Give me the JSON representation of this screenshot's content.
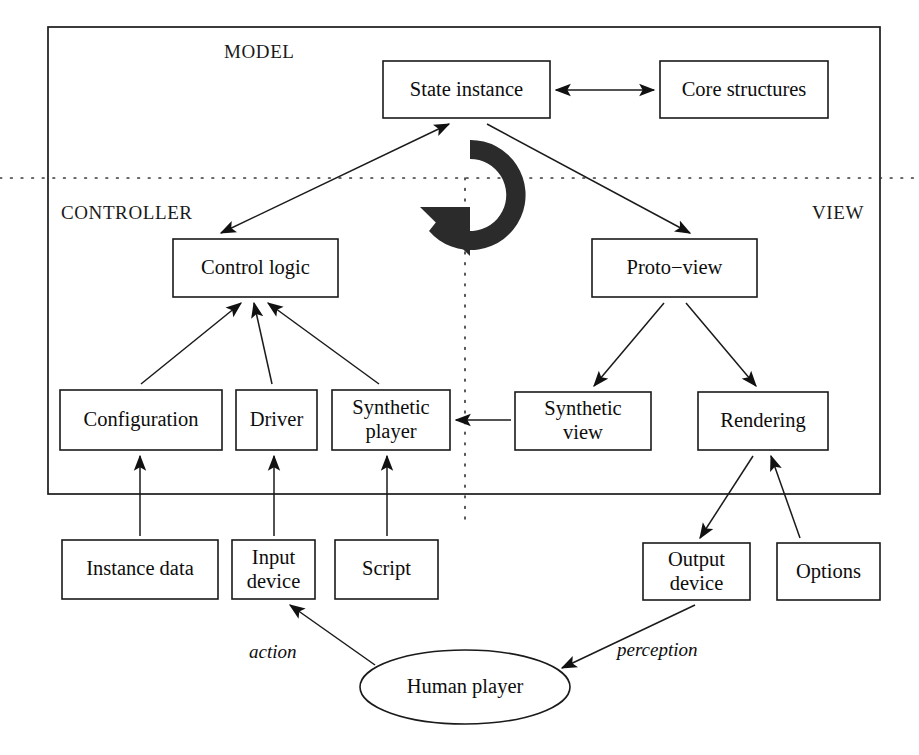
{
  "diagram": {
    "zones": [
      {
        "id": "model",
        "label": "MODEL"
      },
      {
        "id": "controller",
        "label": "CONTROLLER"
      },
      {
        "id": "view",
        "label": "VIEW"
      }
    ],
    "nodes": [
      {
        "id": "state-instance",
        "label": "State instance",
        "shape": "rect",
        "x": 383,
        "y": 61,
        "w": 167,
        "h": 57
      },
      {
        "id": "core-structures",
        "label": "Core structures",
        "shape": "rect",
        "x": 660,
        "y": 61,
        "w": 168,
        "h": 57
      },
      {
        "id": "control-logic",
        "label": "Control logic",
        "shape": "rect",
        "x": 173,
        "y": 239,
        "w": 165,
        "h": 58
      },
      {
        "id": "proto-view",
        "label": "Proto−view",
        "shape": "rect",
        "x": 592,
        "y": 239,
        "w": 165,
        "h": 58
      },
      {
        "id": "configuration",
        "label": "Configuration",
        "shape": "rect",
        "x": 60,
        "y": 390,
        "w": 162,
        "h": 60
      },
      {
        "id": "driver",
        "label": "Driver",
        "shape": "rect",
        "x": 236,
        "y": 390,
        "w": 81,
        "h": 60
      },
      {
        "id": "synthetic-player",
        "label": "Synthetic\nplayer",
        "shape": "rect",
        "x": 332,
        "y": 390,
        "w": 118,
        "h": 60
      },
      {
        "id": "synthetic-view",
        "label": "Synthetic\nview",
        "shape": "rect",
        "x": 515,
        "y": 392,
        "w": 136,
        "h": 58
      },
      {
        "id": "rendering",
        "label": "Rendering",
        "shape": "rect",
        "x": 698,
        "y": 392,
        "w": 130,
        "h": 58
      },
      {
        "id": "instance-data",
        "label": "Instance data",
        "shape": "rect",
        "x": 62,
        "y": 540,
        "w": 156,
        "h": 59
      },
      {
        "id": "input-device",
        "label": "Input\ndevice",
        "shape": "rect",
        "x": 232,
        "y": 540,
        "w": 83,
        "h": 59
      },
      {
        "id": "script",
        "label": "Script",
        "shape": "rect",
        "x": 335,
        "y": 540,
        "w": 103,
        "h": 59
      },
      {
        "id": "output-device",
        "label": "Output\ndevice",
        "shape": "rect",
        "x": 643,
        "y": 543,
        "w": 107,
        "h": 57
      },
      {
        "id": "options",
        "label": "Options",
        "shape": "rect",
        "x": 777,
        "y": 543,
        "w": 103,
        "h": 57
      },
      {
        "id": "human-player",
        "label": "Human player",
        "shape": "ellipse",
        "cx": 465,
        "cy": 687,
        "rx": 105,
        "ry": 37
      }
    ],
    "edges": [
      {
        "id": "state-core",
        "from": "state-instance",
        "to": "core-structures",
        "arrows": "both"
      },
      {
        "id": "control-to-state",
        "from": "control-logic",
        "to": "state-instance",
        "arrows": "both"
      },
      {
        "id": "state-to-proto",
        "from": "state-instance",
        "to": "proto-view",
        "arrows": "single"
      },
      {
        "id": "configuration-control",
        "from": "configuration",
        "to": "control-logic",
        "arrows": "single"
      },
      {
        "id": "driver-control",
        "from": "driver",
        "to": "control-logic",
        "arrows": "single"
      },
      {
        "id": "synthplayer-control",
        "from": "synthetic-player",
        "to": "control-logic",
        "arrows": "single"
      },
      {
        "id": "proto-synthview",
        "from": "proto-view",
        "to": "synthetic-view",
        "arrows": "single"
      },
      {
        "id": "proto-rendering",
        "from": "proto-view",
        "to": "rendering",
        "arrows": "single"
      },
      {
        "id": "synthview-synthplayer",
        "from": "synthetic-view",
        "to": "synthetic-player",
        "arrows": "single"
      },
      {
        "id": "instancedata-config",
        "from": "instance-data",
        "to": "configuration",
        "arrows": "single"
      },
      {
        "id": "inputdevice-driver",
        "from": "input-device",
        "to": "driver",
        "arrows": "single"
      },
      {
        "id": "script-synthplayer",
        "from": "script",
        "to": "synthetic-player",
        "arrows": "single"
      },
      {
        "id": "rendering-outputdev",
        "from": "rendering",
        "to": "output-device",
        "arrows": "single"
      },
      {
        "id": "options-rendering",
        "from": "options",
        "to": "rendering",
        "arrows": "single"
      },
      {
        "id": "human-input",
        "from": "human-player",
        "to": "input-device",
        "arrows": "single",
        "label": "action"
      },
      {
        "id": "output-human",
        "from": "output-device",
        "to": "human-player",
        "arrows": "single",
        "label": "perception"
      }
    ],
    "edge_labels": [
      {
        "id": "action-label",
        "text": "action"
      },
      {
        "id": "perception-label",
        "text": "perception"
      }
    ],
    "glyphs": [
      {
        "id": "cycle-arrow",
        "name": "circular-refresh-arrow"
      }
    ]
  }
}
